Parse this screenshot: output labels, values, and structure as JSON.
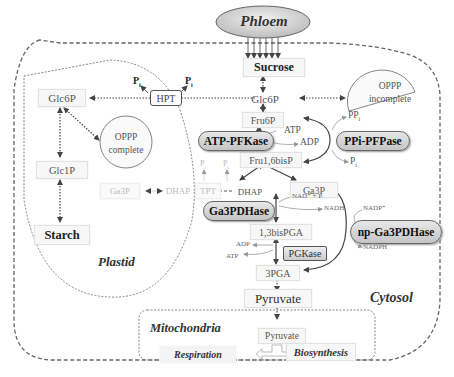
{
  "compartments": {
    "phloem": "Phloem",
    "plastid": "Plastid",
    "cytosol": "Cytosol",
    "mitochondria": "Mitochondria"
  },
  "metabolites": {
    "sucrose": "Sucrose",
    "glc6p_cytosol": "Glc6P",
    "glc6p_plastid": "Glc6P",
    "glc1p": "Glc1P",
    "starch": "Starch",
    "fru6p": "Fru6P",
    "fru16bisp": "Fru1,6bisP",
    "dhap_cytosol": "DHAP",
    "ga3p_cytosol": "Ga3P",
    "ga3p_plastid": "Ga3P",
    "dhap_plastid": "DHAP",
    "bispga": "1,3bisPGA",
    "pga3": "3PGA",
    "pyruvate_cytosol": "Pyruvate",
    "pyruvate_mito": "Pyruvate",
    "respiration": "Respiration",
    "biosynthesis": "Biosynthesis"
  },
  "pathways": {
    "oppp_plastid": [
      "OPPP",
      "complete"
    ],
    "oppp_cytosol": [
      "OPPP",
      "incomplete"
    ]
  },
  "transporters": {
    "hpt": "HPT",
    "tpt": "TPT"
  },
  "enzymes": {
    "atp_pfkase": "ATP-PFKase",
    "ppi_pfpase": "PPi-PFPase",
    "ga3pdhase": "Ga3PDHase",
    "np_ga3pdhase": "np-Ga3PDHase",
    "pgkase": "PGKase"
  },
  "cofactors": {
    "pi": "P",
    "pi_sub": "i",
    "atp": "ATP",
    "adp": "ADP",
    "ppi": "PP",
    "nad_pi": "NAD⁺ + Pᵢ",
    "nadh": "NADH",
    "nadp": "NADP⁺",
    "nadph": "NADPH"
  },
  "colors": {
    "enzyme_fill_top": "#e8e8e8",
    "enzyme_fill_bottom": "#c4c4c4",
    "phloem_fill": "#d0d0d0",
    "arrow": "#444444",
    "faint": "#bbbbbb"
  }
}
